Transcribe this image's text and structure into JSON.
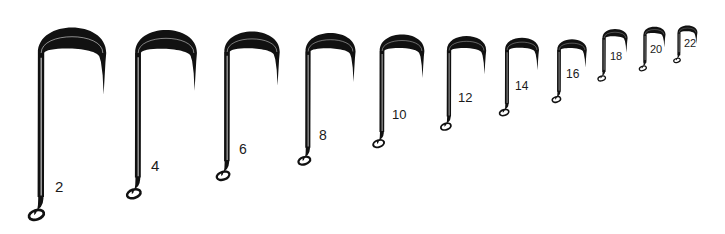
{
  "figure": {
    "background_color": "#ffffff",
    "ink_color": "#111111",
    "label_color": "#1a1a1a",
    "width": 725,
    "height": 234
  },
  "hooks": [
    {
      "id": "hook-size-2",
      "label": "2",
      "shank_x": 41,
      "top_y": 22,
      "eye_y": 214,
      "gape": 62,
      "wire": 3.4,
      "label_x": 55,
      "label_y": 179,
      "label_size": 15
    },
    {
      "id": "hook-size-4",
      "label": "4",
      "shank_x": 138,
      "top_y": 25,
      "eye_y": 193,
      "gape": 56,
      "wire": 3.1,
      "label_x": 151,
      "label_y": 158,
      "label_size": 15
    },
    {
      "id": "hook-size-6",
      "label": "6",
      "shank_x": 227,
      "top_y": 27,
      "eye_y": 175,
      "gape": 50,
      "wire": 2.9,
      "label_x": 239,
      "label_y": 142,
      "label_size": 14
    },
    {
      "id": "hook-size-8",
      "label": "8",
      "shank_x": 308,
      "top_y": 29,
      "eye_y": 160,
      "gape": 45,
      "wire": 2.7,
      "label_x": 319,
      "label_y": 128,
      "label_size": 14
    },
    {
      "id": "hook-size-10",
      "label": "10",
      "shank_x": 382,
      "top_y": 31,
      "eye_y": 143,
      "gape": 40,
      "wire": 2.5,
      "label_x": 392,
      "label_y": 108,
      "label_size": 13
    },
    {
      "id": "hook-size-12",
      "label": "12",
      "shank_x": 449,
      "top_y": 33,
      "eye_y": 126,
      "gape": 35,
      "wire": 2.3,
      "label_x": 458,
      "label_y": 91,
      "label_size": 13
    },
    {
      "id": "hook-size-14",
      "label": "14",
      "shank_x": 507,
      "top_y": 35,
      "eye_y": 112,
      "gape": 30,
      "wire": 2.1,
      "label_x": 515,
      "label_y": 80,
      "label_size": 12
    },
    {
      "id": "hook-size-16",
      "label": "16",
      "shank_x": 559,
      "top_y": 37,
      "eye_y": 99,
      "gape": 26,
      "wire": 1.9,
      "label_x": 566,
      "label_y": 68,
      "label_size": 12
    },
    {
      "id": "hook-size-18",
      "label": "18",
      "shank_x": 604,
      "top_y": 27,
      "eye_y": 78,
      "gape": 22,
      "wire": 1.7,
      "label_x": 610,
      "label_y": 51,
      "label_size": 11
    },
    {
      "id": "hook-size-20",
      "label": "20",
      "shank_x": 645,
      "top_y": 25,
      "eye_y": 68,
      "gape": 19,
      "wire": 1.6,
      "label_x": 650,
      "label_y": 44,
      "label_size": 11
    },
    {
      "id": "hook-size-22",
      "label": "22",
      "shank_x": 679,
      "top_y": 24,
      "eye_y": 60,
      "gape": 17,
      "wire": 1.5,
      "label_x": 684,
      "label_y": 38,
      "label_size": 11
    }
  ]
}
